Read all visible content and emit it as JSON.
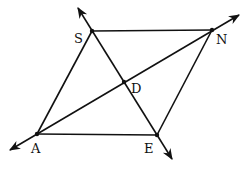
{
  "diagram": {
    "type": "geometry",
    "points": {
      "S": {
        "label": "S",
        "x": 92,
        "y": 31
      },
      "N": {
        "label": "N",
        "x": 212,
        "y": 30
      },
      "A": {
        "label": "A",
        "x": 37,
        "y": 134
      },
      "E": {
        "label": "E",
        "x": 157,
        "y": 135
      },
      "D": {
        "label": "D",
        "x": 124,
        "y": 82
      }
    },
    "segments": [
      "SN",
      "NE",
      "EA",
      "AS"
    ],
    "lines": [
      {
        "through": [
          "S",
          "E"
        ],
        "arrows": "both"
      },
      {
        "through": [
          "A",
          "N"
        ],
        "arrows": "both"
      }
    ],
    "labels": {
      "S": "S",
      "N": "N",
      "A": "A",
      "E": "E",
      "D": "D"
    },
    "colors": {
      "stroke": "#111111",
      "background": "#ffffff"
    }
  }
}
